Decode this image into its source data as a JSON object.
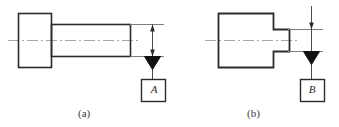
{
  "figure": {
    "background_color": "#ffffff",
    "line_color": "#2b2b2b",
    "centerline_color": "#a9a9a9",
    "subfigures": [
      {
        "id": "a",
        "caption": "(a)",
        "datum_letter": "A",
        "part_description": "stepped cylindrical pin with head",
        "datum_target": "shank top surface"
      },
      {
        "id": "b",
        "caption": "(b)",
        "datum_letter": "B",
        "part_description": "slotted fork block",
        "datum_target": "tongue top surface"
      }
    ]
  },
  "subfigure_a": {
    "caption": "(a)",
    "datum_letter": "A"
  },
  "subfigure_b": {
    "caption": "(b)",
    "datum_letter": "B"
  }
}
